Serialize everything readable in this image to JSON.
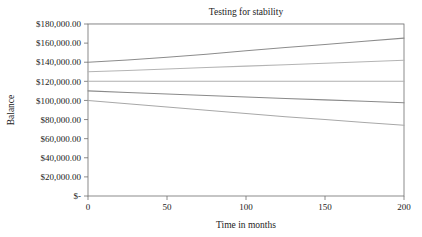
{
  "chart_data": {
    "type": "line",
    "title": "Testing for stability",
    "xlabel": "Time in months",
    "ylabel": "Balance",
    "xlim": [
      0,
      200
    ],
    "ylim": [
      0,
      180000
    ],
    "grid": true,
    "legend": "none",
    "x_ticks": [
      0,
      50,
      100,
      150,
      200
    ],
    "x_tick_labels": [
      "0",
      "50",
      "100",
      "150",
      "200"
    ],
    "y_ticks": [
      0,
      20000,
      40000,
      60000,
      80000,
      100000,
      120000,
      140000,
      160000,
      180000
    ],
    "y_tick_labels": [
      "$-",
      "$20,000.00",
      "$40,000.00",
      "$60,000.00",
      "$80,000.00",
      "$100,000.00",
      "$120,000.00",
      "$140,000.00",
      "$160,000.00",
      "$180,000.00"
    ],
    "x": [
      0,
      25,
      50,
      75,
      100,
      125,
      150,
      175,
      200
    ],
    "series": [
      {
        "name": "series-1",
        "color": "#8c8c8c",
        "values": [
          140000,
          142400,
          145200,
          148400,
          152000,
          155400,
          158600,
          161900,
          165200
        ]
      },
      {
        "name": "series-2",
        "color": "#b4b4b4",
        "values": [
          130000,
          131400,
          132900,
          134400,
          135900,
          137400,
          138900,
          140400,
          142000
        ]
      },
      {
        "name": "series-3",
        "color": "#b0b0b0",
        "values": [
          120000,
          120000,
          120000,
          120000,
          120000,
          120000,
          120000,
          120000,
          120000
        ]
      },
      {
        "name": "series-4",
        "color": "#8a8a8a",
        "values": [
          110000,
          108400,
          106800,
          105200,
          103600,
          102100,
          100600,
          99100,
          97500
        ]
      },
      {
        "name": "series-5",
        "color": "#a8a8a8",
        "values": [
          100000,
          96600,
          93200,
          89800,
          86400,
          83000,
          80000,
          77000,
          74000
        ]
      }
    ]
  }
}
